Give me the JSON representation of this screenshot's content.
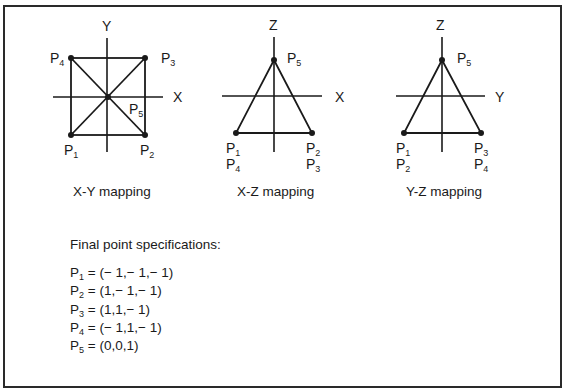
{
  "diagrams": {
    "xy": {
      "caption": "X-Y mapping",
      "horizontal_axis": "X",
      "vertical_axis": "Y",
      "points": [
        {
          "label": "P",
          "sub": "1",
          "position": "bottom-left"
        },
        {
          "label": "P",
          "sub": "2",
          "position": "bottom-right"
        },
        {
          "label": "P",
          "sub": "3",
          "position": "top-right"
        },
        {
          "label": "P",
          "sub": "4",
          "position": "top-left"
        },
        {
          "label": "P",
          "sub": "5",
          "position": "center"
        }
      ]
    },
    "xz": {
      "caption": "X-Z mapping",
      "horizontal_axis": "X",
      "vertical_axis": "Z",
      "points": [
        {
          "label": "P",
          "sub": "5",
          "position": "apex"
        },
        {
          "labels": [
            {
              "label": "P",
              "sub": "1"
            },
            {
              "label": "P",
              "sub": "4"
            }
          ],
          "position": "bottom-left"
        },
        {
          "labels": [
            {
              "label": "P",
              "sub": "2"
            },
            {
              "label": "P",
              "sub": "3"
            }
          ],
          "position": "bottom-right"
        }
      ]
    },
    "yz": {
      "caption": "Y-Z mapping",
      "horizontal_axis": "Y",
      "vertical_axis": "Z",
      "points": [
        {
          "label": "P",
          "sub": "5",
          "position": "apex"
        },
        {
          "labels": [
            {
              "label": "P",
              "sub": "1"
            },
            {
              "label": "P",
              "sub": "2"
            }
          ],
          "position": "bottom-left"
        },
        {
          "labels": [
            {
              "label": "P",
              "sub": "3"
            },
            {
              "label": "P",
              "sub": "4"
            }
          ],
          "position": "bottom-right"
        }
      ]
    }
  },
  "specifications": {
    "title": "Final point specifications:",
    "rows": [
      {
        "label": "P",
        "sub": "1",
        "value": " = (− 1,− 1,− 1)"
      },
      {
        "label": "P",
        "sub": "2",
        "value": " = (1,− 1,− 1)"
      },
      {
        "label": "P",
        "sub": "3",
        "value": " = (1,1,− 1)"
      },
      {
        "label": "P",
        "sub": "4",
        "value": " = (− 1,1,− 1)"
      },
      {
        "label": "P",
        "sub": "5",
        "value": " = (0,0,1)"
      }
    ]
  },
  "colors": {
    "line": "#1a1a1a",
    "border": "#2a2a2a",
    "background": "#ffffff"
  }
}
